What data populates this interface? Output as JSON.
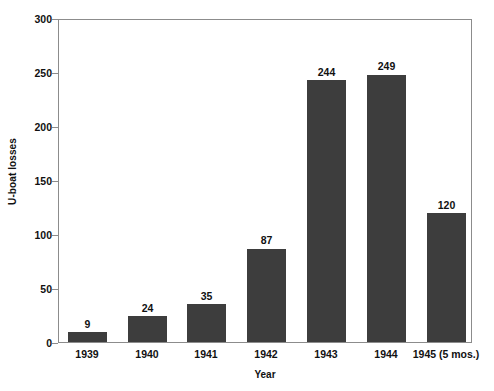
{
  "chart_data": {
    "type": "bar",
    "title": "",
    "xlabel": "Year",
    "ylabel": "U-boat losses",
    "categories": [
      "1939",
      "1940",
      "1941",
      "1942",
      "1943",
      "1944",
      "1945 (5 mos.)"
    ],
    "values": [
      9,
      24,
      35,
      87,
      244,
      249,
      120
    ],
    "value_labels": [
      "9",
      "24",
      "35",
      "87",
      "244",
      "249",
      "120"
    ],
    "ylim": [
      0,
      300
    ],
    "ytick_labels": [
      "0",
      "50",
      "100",
      "150",
      "200",
      "250",
      "300"
    ],
    "ytick_values": [
      0,
      50,
      100,
      150,
      200,
      250,
      300
    ],
    "grid": false,
    "legend": false,
    "bar_color": "#3d3d3d",
    "frame_color": "#8c8c8c",
    "background_color": "#ffffff",
    "text_color": "#111111"
  }
}
